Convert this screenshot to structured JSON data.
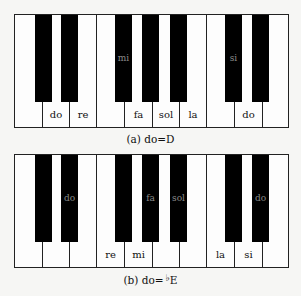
{
  "figure": {
    "keyboard_a": {
      "caption_prefix": "(a) do=",
      "caption_key": "D",
      "white_keys": [
        "",
        "do",
        "re",
        "",
        "fa",
        "sol",
        "la",
        "",
        "do",
        ""
      ],
      "black_keys": [
        "",
        "",
        "mi",
        "",
        "",
        "si",
        ""
      ]
    },
    "keyboard_b": {
      "caption_prefix": "(b) do=",
      "caption_flat": "♭",
      "caption_key": "E",
      "white_keys": [
        "",
        "",
        "",
        "re",
        "mi",
        "",
        "",
        "la",
        "si",
        ""
      ],
      "black_keys": [
        "",
        "do",
        "",
        "fa",
        "sol",
        "",
        "do"
      ]
    }
  },
  "colors": {
    "background": "#f6f6f4",
    "black_key": "#000000",
    "white_key": "#fdfdfd",
    "black_key_label": "#8a8a8a"
  }
}
